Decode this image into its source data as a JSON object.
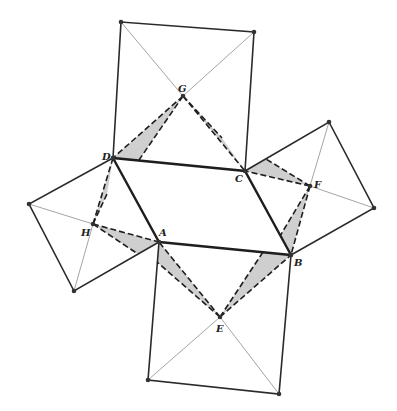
{
  "figure": {
    "colors": {
      "stroke": "#2a2a2a",
      "thin": "#9a9a9a",
      "shade": "#cfcfcf",
      "point": "#333333"
    },
    "points": {
      "A": {
        "label": "A",
        "x": 159,
        "y": 242,
        "lx": 159,
        "ly": 236
      },
      "B": {
        "label": "B",
        "x": 291,
        "y": 255,
        "lx": 294,
        "ly": 266
      },
      "C": {
        "label": "C",
        "x": 245,
        "y": 171,
        "lx": 235,
        "ly": 181
      },
      "D": {
        "label": "D",
        "x": 113,
        "y": 158,
        "lx": 103,
        "ly": 158
      },
      "E": {
        "label": "E",
        "x": 220,
        "y": 317,
        "lx": 216,
        "ly": 331
      },
      "F": {
        "label": "F",
        "x": 310,
        "y": 186,
        "lx": 314,
        "ly": 186
      },
      "G": {
        "label": "G",
        "x": 183,
        "y": 96,
        "lx": 177,
        "ly": 91
      },
      "H": {
        "label": "H",
        "x": 93,
        "y": 224,
        "lx": 81,
        "ly": 234
      }
    },
    "square_corners": {
      "top": [
        [
          113,
          158
        ],
        [
          121,
          22
        ],
        [
          254,
          32
        ],
        [
          245,
          171
        ]
      ],
      "right": [
        [
          245,
          171
        ],
        [
          329,
          122
        ],
        [
          374,
          208
        ],
        [
          291,
          255
        ]
      ],
      "bottom": [
        [
          159,
          242
        ],
        [
          291,
          255
        ],
        [
          279,
          394
        ],
        [
          148,
          380
        ]
      ],
      "left": [
        [
          113,
          158
        ],
        [
          29,
          204
        ],
        [
          74,
          291
        ],
        [
          159,
          242
        ]
      ]
    }
  }
}
